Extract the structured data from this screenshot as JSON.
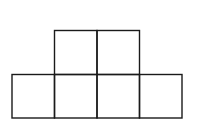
{
  "diagram": {
    "type": "grid-net",
    "stroke_color": "#1a1a1a",
    "background": "#ffffff",
    "cell_size": {
      "width": 42.5,
      "height": 44
    },
    "rows": [
      {
        "name": "top-row",
        "cell_count": 2,
        "start_column": 1
      },
      {
        "name": "bottom-row",
        "cell_count": 4,
        "start_column": 0
      }
    ],
    "cells": [
      {
        "id": "top-1",
        "row": 0,
        "col": 1
      },
      {
        "id": "top-2",
        "row": 0,
        "col": 2
      },
      {
        "id": "bottom-1",
        "row": 1,
        "col": 0
      },
      {
        "id": "bottom-2",
        "row": 1,
        "col": 1
      },
      {
        "id": "bottom-3",
        "row": 1,
        "col": 2
      },
      {
        "id": "bottom-4",
        "row": 1,
        "col": 3
      }
    ]
  }
}
